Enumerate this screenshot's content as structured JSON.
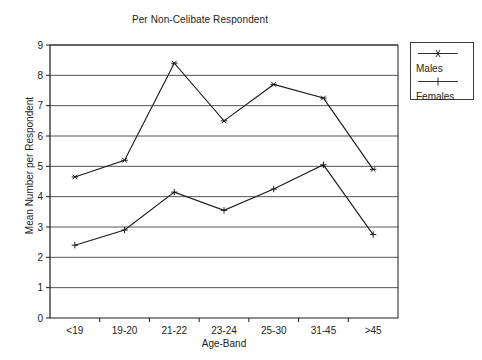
{
  "chart_data": {
    "type": "line",
    "title": "Per Non-Celibate Respondent",
    "xlabel": "Age-Band",
    "ylabel": "Mean Number per Respondent",
    "categories": [
      "<19",
      "19-20",
      "21-22",
      "23-24",
      "25-30",
      "31-45",
      ">45"
    ],
    "ylim": [
      0,
      9
    ],
    "yticks": [
      0,
      1,
      2,
      3,
      4,
      5,
      6,
      7,
      8,
      9
    ],
    "grid": "horizontal",
    "legend_position": "right-outside",
    "series": [
      {
        "name": "Males",
        "marker": "asterisk",
        "color": "#1a1a1a",
        "values": [
          4.65,
          5.2,
          8.4,
          6.5,
          7.7,
          7.25,
          4.9
        ]
      },
      {
        "name": "Females",
        "marker": "plus",
        "color": "#1a1a1a",
        "values": [
          2.4,
          2.9,
          4.15,
          3.55,
          4.25,
          5.05,
          2.75
        ]
      }
    ]
  },
  "legend": {
    "items": [
      {
        "label": "Males",
        "marker": "asterisk"
      },
      {
        "label": "Females",
        "marker": "plus"
      }
    ]
  }
}
